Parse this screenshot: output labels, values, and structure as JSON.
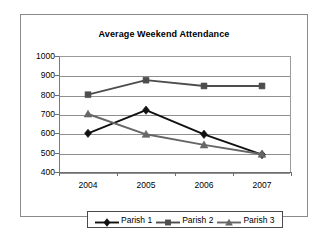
{
  "chart_data": {
    "type": "line",
    "title": "Average Weekend Attendance",
    "xlabel": "",
    "ylabel": "",
    "categories": [
      "2004",
      "2005",
      "2006",
      "2007"
    ],
    "ylim": [
      400,
      1000
    ],
    "ytick_labels": [
      "1000",
      "900",
      "800",
      "700",
      "600",
      "500",
      "400"
    ],
    "yticks": [
      1000,
      900,
      800,
      700,
      600,
      500,
      400
    ],
    "grid": true,
    "legend_position": "bottom",
    "series": [
      {
        "name": "Parish 1",
        "values": [
          600,
          720,
          595,
          490
        ],
        "color": "#111111",
        "marker": "diamond"
      },
      {
        "name": "Parish 2",
        "values": [
          800,
          875,
          845,
          845
        ],
        "color": "#4d4d4d",
        "marker": "square"
      },
      {
        "name": "Parish 3",
        "values": [
          700,
          595,
          540,
          492
        ],
        "color": "#666666",
        "marker": "triangle"
      }
    ]
  },
  "legend": {
    "items": [
      {
        "label": "Parish 1"
      },
      {
        "label": "Parish 2"
      },
      {
        "label": "Parish 3"
      }
    ]
  },
  "colors": {
    "frame_border": "#8a8a8a",
    "gridline": "#8f8f8f",
    "axis": "#6f6f6f",
    "text": "#000000",
    "background": "#ffffff"
  }
}
